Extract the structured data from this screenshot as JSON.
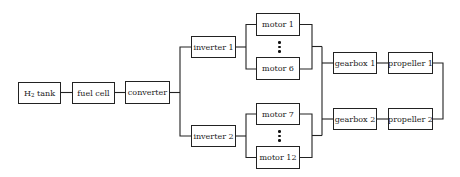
{
  "diagram": {
    "type": "reliability-block-diagram",
    "blocks": {
      "h2_tank": {
        "label_main": "H",
        "label_sub": "2",
        "label_rest": " tank"
      },
      "fuel_cell": {
        "label": "fuel cell"
      },
      "converter": {
        "label": "converter"
      },
      "inverter_1": {
        "label": "inverter 1"
      },
      "inverter_2": {
        "label": "inverter 2"
      },
      "motor_1": {
        "label": "motor 1"
      },
      "motor_6": {
        "label": "motor 6"
      },
      "motor_7": {
        "label": "motor 7"
      },
      "motor_12": {
        "label": "motor 12"
      },
      "gearbox_1": {
        "label": "gearbox 1"
      },
      "gearbox_2": {
        "label": "gearbox 2"
      },
      "propeller_1": {
        "label": "propeller 1"
      },
      "propeller_2": {
        "label": "propeller 2"
      }
    },
    "ellipsis_markers": [
      "motors 2-5 (vertical ellipsis)",
      "motors 8-11 (vertical ellipsis)"
    ],
    "colors": {
      "line": "#222222",
      "background": "#ffffff"
    }
  }
}
